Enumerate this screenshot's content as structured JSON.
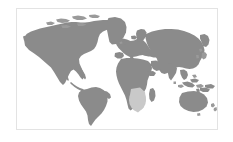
{
  "figure": {
    "kind": "world-map-thumbnail",
    "projection": "equirectangular",
    "border_color": "#e3e3e3",
    "ocean_color": "#ffffff",
    "land_color": "#8b8b8b",
    "highlight_color": "#c9c9c9",
    "page_background": "#ffffff"
  },
  "frame": {
    "x": 16,
    "y": 8,
    "width": 202,
    "height": 122
  },
  "legend": {
    "visible": false,
    "entries": []
  },
  "labels": {
    "visible": false,
    "texts": []
  },
  "regions": [
    {
      "name": "north-america",
      "state": "land"
    },
    {
      "name": "greenland",
      "state": "land"
    },
    {
      "name": "south-america",
      "state": "land"
    },
    {
      "name": "europe",
      "state": "land"
    },
    {
      "name": "africa",
      "state": "land"
    },
    {
      "name": "asia",
      "state": "land"
    },
    {
      "name": "australia",
      "state": "land"
    },
    {
      "name": "new-zealand",
      "state": "land"
    },
    {
      "name": "madagascar",
      "state": "land"
    },
    {
      "name": "southern-africa-highlight",
      "state": "highlighted"
    }
  ]
}
